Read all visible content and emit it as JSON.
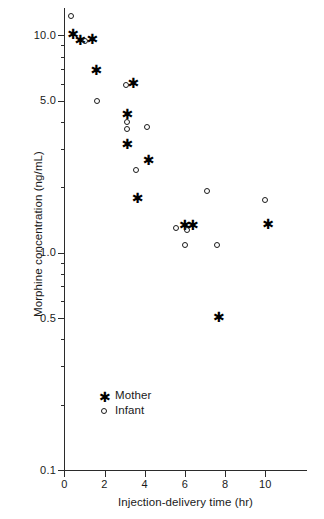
{
  "chart_data": {
    "type": "scatter",
    "title": "",
    "xlabel": "Injection-delivery time (hr)",
    "ylabel": "Morphine concentration (ng/mL)",
    "xlim": [
      0,
      12.1
    ],
    "ylim": [
      0.1,
      13.5
    ],
    "yscale": "log",
    "xscale": "linear",
    "grid": false,
    "legend_position": "lower-left-inside",
    "xticks": [
      "0",
      "2",
      "4",
      "6",
      "8",
      "10"
    ],
    "xtick_values": [
      0,
      2,
      4,
      6,
      8,
      10
    ],
    "yticks": [
      "10.0",
      "5.0",
      "1.0",
      "0.5",
      "0.1"
    ],
    "ytick_values": [
      10.0,
      5.0,
      1.0,
      0.5,
      0.1
    ],
    "yminor_values": [
      9,
      8,
      7,
      6,
      4,
      3,
      2,
      0.9,
      0.8,
      0.7,
      0.6,
      0.4,
      0.3,
      0.2
    ],
    "series": [
      {
        "name": "Mother",
        "marker": "star",
        "color": "#000000",
        "points": [
          {
            "x": 0.4,
            "y": 10.3
          },
          {
            "x": 0.75,
            "y": 9.6
          },
          {
            "x": 1.35,
            "y": 9.7
          },
          {
            "x": 1.55,
            "y": 7.0
          },
          {
            "x": 3.4,
            "y": 6.1
          },
          {
            "x": 3.1,
            "y": 4.4
          },
          {
            "x": 3.1,
            "y": 3.2
          },
          {
            "x": 4.15,
            "y": 2.7
          },
          {
            "x": 3.6,
            "y": 1.8
          },
          {
            "x": 5.95,
            "y": 1.35
          },
          {
            "x": 6.35,
            "y": 1.35
          },
          {
            "x": 7.65,
            "y": 0.51
          },
          {
            "x": 10.1,
            "y": 1.37
          }
        ]
      },
      {
        "name": "Infant",
        "marker": "circle",
        "color": "#1a1a1a",
        "points": [
          {
            "x": 0.32,
            "y": 12.3
          },
          {
            "x": 1.05,
            "y": 9.4
          },
          {
            "x": 1.6,
            "y": 5.0
          },
          {
            "x": 3.05,
            "y": 5.9
          },
          {
            "x": 3.1,
            "y": 4.0
          },
          {
            "x": 3.1,
            "y": 3.7
          },
          {
            "x": 4.1,
            "y": 3.8
          },
          {
            "x": 3.55,
            "y": 2.4
          },
          {
            "x": 7.1,
            "y": 1.92
          },
          {
            "x": 10.0,
            "y": 1.75
          },
          {
            "x": 5.55,
            "y": 1.3
          },
          {
            "x": 6.1,
            "y": 1.27
          },
          {
            "x": 6.0,
            "y": 1.09
          },
          {
            "x": 7.6,
            "y": 1.08
          }
        ]
      }
    ]
  },
  "legend": {
    "items": [
      {
        "label": "Mother",
        "marker": "star"
      },
      {
        "label": "Infant",
        "marker": "circle"
      }
    ]
  },
  "icons": {
    "star_glyph": "✱",
    "circle_glyph": "○"
  }
}
